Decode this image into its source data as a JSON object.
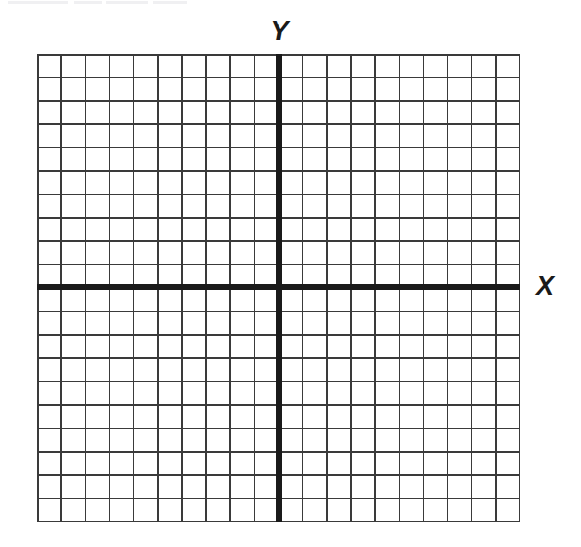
{
  "figure": {
    "kind": "blank-cartesian-grid",
    "background_color": "#ffffff",
    "ink_color": "#1a1a1a",
    "gridline_color": "#3a3a3a"
  },
  "labels": {
    "y_axis": "Y",
    "x_axis": "X"
  },
  "chart_data": {
    "type": "scatter",
    "title": "",
    "subtitle": "",
    "xlabel": "X",
    "ylabel": "Y",
    "series": [],
    "x": [],
    "values": [],
    "categories": [],
    "annotations": [],
    "legend": [],
    "legend_position": "none",
    "grid": true,
    "grid_columns": 20,
    "grid_rows": 20,
    "cell_width_px": 24.15,
    "cell_height_px": 23.4,
    "xlim": [
      -10,
      10
    ],
    "ylim": [
      -10,
      10
    ],
    "x_major_every": 1,
    "y_major_every": 1,
    "xticks": [],
    "yticks": [],
    "xtick_labels": [],
    "ytick_labels": [],
    "origin_px": [
      279,
      287
    ],
    "axis_line_width_px": 6,
    "grid_line_width_px": 1.5,
    "axes_visible": {
      "x_axis": true,
      "y_axis": true
    },
    "plot_area_px": {
      "left": 37,
      "top": 54,
      "width": 483,
      "height": 468
    }
  }
}
